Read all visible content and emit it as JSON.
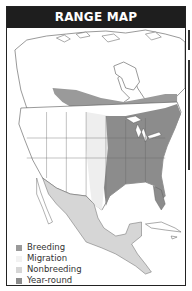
{
  "header": {
    "title": "RANGE MAP"
  },
  "legend": {
    "items": [
      {
        "label": "Breeding",
        "color": "#9a9a9a"
      },
      {
        "label": "Migration",
        "color": "#f2f2f2"
      },
      {
        "label": "Nonbreeding",
        "color": "#d6d6d6"
      },
      {
        "label": "Year-round",
        "color": "#8c8c8c"
      }
    ]
  },
  "colors": {
    "header_bg": "#1e1e1e",
    "land": "#ffffff",
    "border_lines": "#555555",
    "year_round": "#8c8c8c",
    "breeding": "#9a9a9a",
    "migration": "#eeeeee",
    "nonbreeding": "#d6d6d6"
  }
}
